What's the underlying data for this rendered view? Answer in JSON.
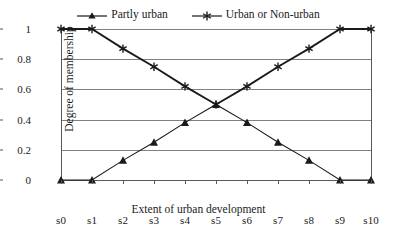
{
  "chart_data": {
    "type": "line",
    "title": "",
    "xlabel": "Extent of urban development",
    "ylabel": "Degree of membership",
    "categories": [
      "s0",
      "s1",
      "s2",
      "s3",
      "s4",
      "s5",
      "s6",
      "s7",
      "s8",
      "s9",
      "s10"
    ],
    "yticks": [
      "0",
      "0.2",
      "0.4",
      "0.6",
      "0.8",
      "1"
    ],
    "ytick_values": [
      0,
      0.2,
      0.4,
      0.6,
      0.8,
      1
    ],
    "ylim": [
      0,
      1
    ],
    "grid": true,
    "legend_position": "top-center",
    "series": [
      {
        "name": "Partly urban",
        "marker": "triangle",
        "color": "#1a1a1a",
        "values": [
          0,
          0,
          0.13,
          0.25,
          0.38,
          0.5,
          0.38,
          0.25,
          0.13,
          0,
          0
        ]
      },
      {
        "name": "Urban or Non-urban",
        "marker": "asterisk",
        "color": "#1a1a1a",
        "values": [
          1,
          1,
          0.87,
          0.75,
          0.62,
          0.5,
          0.62,
          0.75,
          0.87,
          1,
          1
        ]
      }
    ]
  },
  "colors": {
    "grid": "#808080",
    "axis": "#595959",
    "text": "#1a1a1a",
    "background": "#ffffff"
  }
}
